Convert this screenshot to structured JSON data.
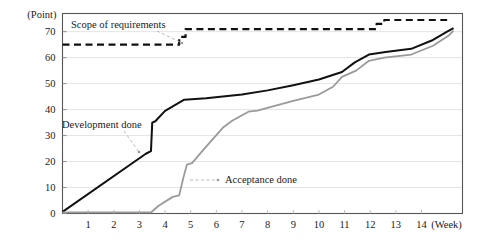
{
  "chart_data": {
    "type": "line",
    "title": "",
    "xlabel": "(Week)",
    "ylabel": "(Point)",
    "xlim": [
      0,
      15.6
    ],
    "ylim": [
      0,
      77
    ],
    "grid": true,
    "grid_axis": "y",
    "legend_position": "inline-annotations",
    "x_ticks": [
      1,
      2,
      3,
      4,
      5,
      6,
      7,
      8,
      9,
      10,
      11,
      12,
      13,
      14
    ],
    "y_ticks": [
      0,
      10,
      20,
      30,
      40,
      50,
      60,
      70
    ],
    "series": [
      {
        "name": "Scope of requirements",
        "style": "dashed",
        "color": "#111111",
        "width": 2.2,
        "points": [
          [
            0.0,
            65
          ],
          [
            4.55,
            65
          ],
          [
            4.55,
            68
          ],
          [
            4.8,
            68
          ],
          [
            4.8,
            71
          ],
          [
            12.25,
            71
          ],
          [
            12.25,
            73
          ],
          [
            12.55,
            73
          ],
          [
            12.55,
            74.5
          ],
          [
            15.0,
            74.5
          ]
        ]
      },
      {
        "name": "Development done",
        "style": "solid",
        "color": "#111111",
        "width": 2.0,
        "points": [
          [
            0.0,
            0.6
          ],
          [
            3.25,
            23
          ],
          [
            3.45,
            24
          ],
          [
            3.5,
            35
          ],
          [
            3.62,
            35.5
          ],
          [
            4.0,
            39.5
          ],
          [
            4.75,
            43.8
          ],
          [
            5.6,
            44.4
          ],
          [
            7.0,
            45.8
          ],
          [
            8.0,
            47.4
          ],
          [
            9.0,
            49.4
          ],
          [
            10.0,
            51.6
          ],
          [
            10.9,
            54.5
          ],
          [
            11.4,
            58.2
          ],
          [
            11.95,
            61.2
          ],
          [
            12.6,
            62.2
          ],
          [
            13.6,
            63.4
          ],
          [
            14.4,
            66.6
          ],
          [
            15.0,
            70.0
          ],
          [
            15.25,
            71.4
          ]
        ]
      },
      {
        "name": "Acceptance done",
        "style": "solid",
        "color": "#9a9a9a",
        "width": 1.8,
        "points": [
          [
            0.0,
            0.4
          ],
          [
            3.45,
            0.4
          ],
          [
            3.75,
            3.0
          ],
          [
            4.3,
            6.4
          ],
          [
            4.55,
            7.0
          ],
          [
            4.72,
            14.0
          ],
          [
            4.85,
            18.8
          ],
          [
            5.05,
            19.4
          ],
          [
            5.5,
            24.6
          ],
          [
            6.25,
            33.0
          ],
          [
            6.6,
            35.6
          ],
          [
            7.25,
            39.2
          ],
          [
            7.6,
            39.6
          ],
          [
            8.1,
            41.0
          ],
          [
            9.0,
            43.4
          ],
          [
            10.0,
            45.8
          ],
          [
            10.55,
            48.8
          ],
          [
            10.9,
            52.6
          ],
          [
            11.45,
            55.0
          ],
          [
            11.95,
            58.8
          ],
          [
            12.55,
            60.0
          ],
          [
            13.6,
            61.2
          ],
          [
            14.45,
            64.6
          ],
          [
            15.05,
            68.4
          ],
          [
            15.25,
            70.4
          ]
        ]
      }
    ],
    "annotations": [
      {
        "name": "scope-of-requirements-label",
        "text": "Scope of requirements",
        "text_x": 71,
        "text_y": 28,
        "leader": [
          [
            157,
            31
          ],
          [
            182,
            43
          ]
        ]
      },
      {
        "name": "development-done-label",
        "text": "Development done",
        "text_x": 62,
        "text_y": 128,
        "leader": [
          [
            124,
            131
          ],
          [
            139,
            152
          ]
        ]
      },
      {
        "name": "acceptance-done-label",
        "text": "Acceptance done",
        "text_x": 225,
        "text_y": 183,
        "leader": [
          [
            190,
            180
          ],
          [
            218,
            180
          ]
        ]
      }
    ]
  },
  "axes": {
    "y_unit_label": "(Point)",
    "x_unit_label": "(Week)",
    "y_tick_labels": [
      "0",
      "10",
      "20",
      "30",
      "40",
      "50",
      "60",
      "70"
    ],
    "x_tick_labels": [
      "1",
      "2",
      "3",
      "4",
      "5",
      "6",
      "7",
      "8",
      "9",
      "10",
      "11",
      "12",
      "13",
      "14"
    ]
  },
  "colors": {
    "plot_border": "#555555",
    "gridline": "#e4e4e4",
    "scope_line": "#111111",
    "development_line": "#111111",
    "acceptance_line": "#9a9a9a",
    "background": "#ffffff",
    "text": "#1a1a1a"
  }
}
